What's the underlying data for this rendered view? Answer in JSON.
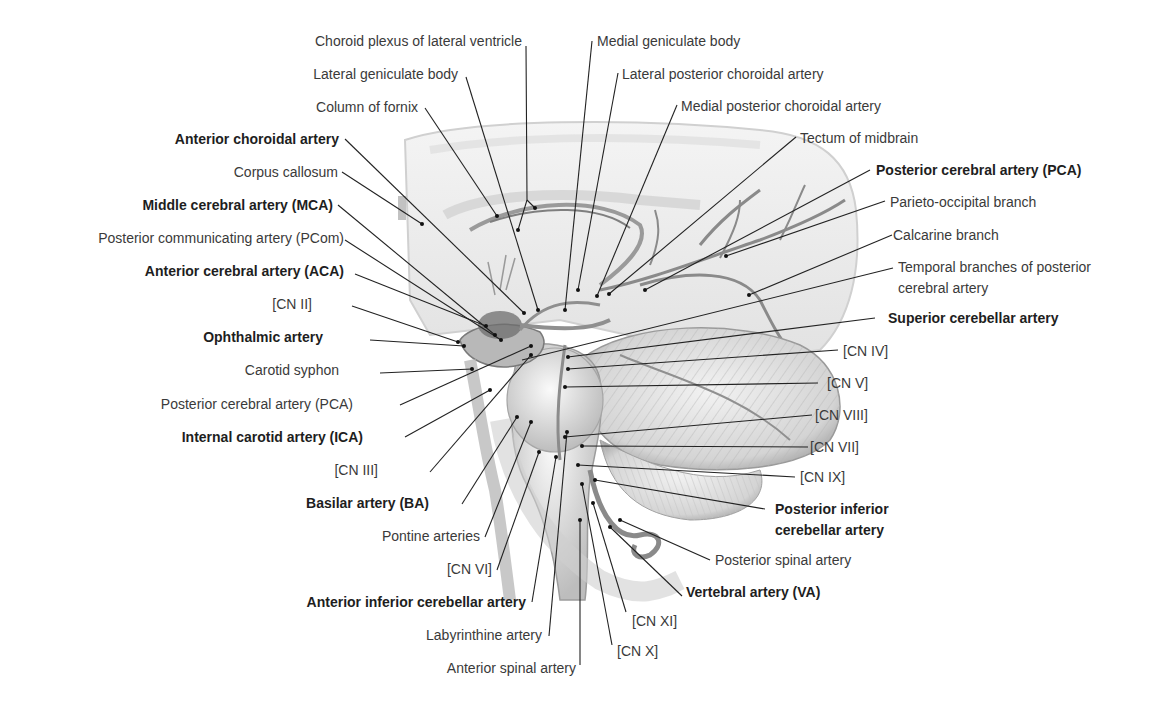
{
  "figure": {
    "type": "anatomical illustration"
  },
  "labels": {
    "choroid_plexus": "Choroid plexus of lateral ventricle",
    "lat_geniculate": "Lateral geniculate body",
    "column_fornix": "Column of fornix",
    "ant_choroidal": "Anterior choroidal artery",
    "corpus_callosum": "Corpus callosum",
    "mca": "Middle cerebral artery (MCA)",
    "pcom": "Posterior communicating artery (PCom)",
    "aca": "Anterior cerebral artery (ACA)",
    "cn2": "[CN II]",
    "ophthalmic": "Ophthalmic artery",
    "carotid_syphon": "Carotid syphon",
    "pca_left": "Posterior cerebral artery (PCA)",
    "ica": "Internal carotid artery (ICA)",
    "cn3": "[CN III]",
    "basilar": "Basilar artery (BA)",
    "pontine": "Pontine arteries",
    "cn6": "[CN VI]",
    "aica": "Anterior inferior cerebellar artery",
    "labyrinthine": "Labyrinthine artery",
    "ant_spinal": "Anterior spinal artery",
    "med_geniculate": "Medial geniculate body",
    "lat_post_choroidal": "Lateral posterior choroidal artery",
    "med_post_choroidal": "Medial posterior choroidal artery",
    "tectum": "Tectum of midbrain",
    "pca_right": "Posterior cerebral artery (PCA)",
    "parieto_occipital": "Parieto-occipital branch",
    "calcarine": "Calcarine branch",
    "temporal_branches_1": "Temporal branches of posterior",
    "temporal_branches_2": "cerebral artery",
    "sca": "Superior cerebellar artery",
    "cn4": "[CN IV]",
    "cn5": "[CN V]",
    "cn8": "[CN VIII]",
    "cn7": "[CN VII]",
    "cn9": "[CN IX]",
    "pica_1": "Posterior inferior",
    "pica_2": "cerebellar artery",
    "post_spinal": "Posterior spinal artery",
    "vertebral": "Vertebral artery (VA)",
    "cn11": "[CN XI]",
    "cn10": "[CN X]"
  },
  "colors": {
    "background": "#ffffff",
    "text": "#3a3a3a",
    "text_bold": "#1e1e1e",
    "leader_line": "#222222",
    "tissue_light": "#e9e9e9",
    "tissue_mid": "#c8c8c8",
    "vessel": "#8a8a8a"
  }
}
